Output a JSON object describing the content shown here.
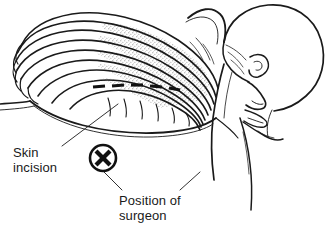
{
  "figure": {
    "background_color": "#ffffff",
    "ink_color": "#1a1a1a",
    "stipple_color": "#8c8c8c",
    "incision_color": "#111111"
  },
  "labels": {
    "skin_incision": "Skin\nincision",
    "position_of_surgeon": "Position of\nsurgeon"
  },
  "markers": {
    "surgeon_position_symbol": "X"
  },
  "anatomy": {
    "parts": [
      "head-profile",
      "ear",
      "nose",
      "mouth",
      "chin",
      "neck",
      "shoulder",
      "rib-cage",
      "ribs",
      "intercostal-spaces",
      "torso-outline",
      "operating-table-edge"
    ],
    "rib_count": 9
  }
}
